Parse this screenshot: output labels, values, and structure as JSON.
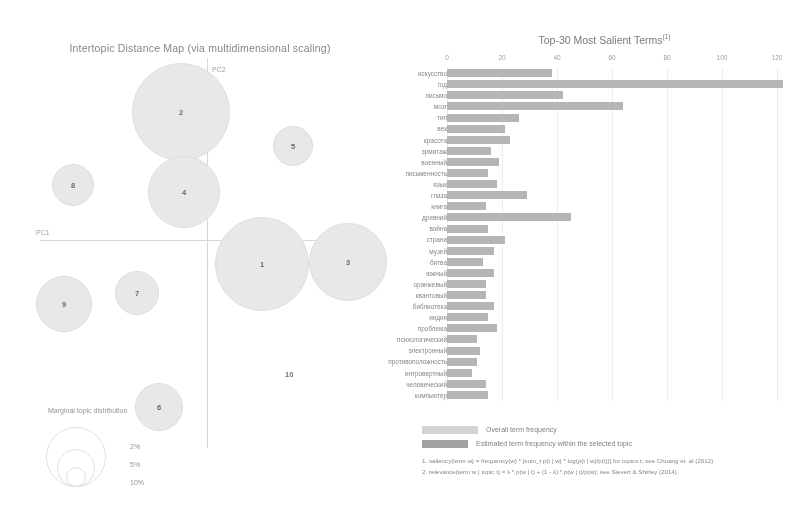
{
  "left": {
    "title": "Intertopic Distance Map (via multidimensional scaling)",
    "axis_labels": {
      "x": "PC1",
      "y": "PC2"
    },
    "topics": [
      {
        "id": "1",
        "x": 262,
        "y": 264,
        "r": 47
      },
      {
        "id": "2",
        "x": 181,
        "y": 112,
        "r": 49
      },
      {
        "id": "3",
        "x": 348,
        "y": 262,
        "r": 39
      },
      {
        "id": "4",
        "x": 184,
        "y": 192,
        "r": 36
      },
      {
        "id": "5",
        "x": 293,
        "y": 146,
        "r": 20
      },
      {
        "id": "6",
        "x": 159,
        "y": 407,
        "r": 24
      },
      {
        "id": "7",
        "x": 137,
        "y": 293,
        "r": 22
      },
      {
        "id": "8",
        "x": 73,
        "y": 185,
        "r": 21
      },
      {
        "id": "9",
        "x": 64,
        "y": 304,
        "r": 28
      }
    ],
    "ghost_topic": {
      "id": "10",
      "x": 285,
      "y": 370
    },
    "marginal": {
      "title": "Marginal topic distribution",
      "items": [
        {
          "label": "2%",
          "r": 10
        },
        {
          "label": "5%",
          "r": 19
        },
        {
          "label": "10%",
          "r": 30
        }
      ]
    }
  },
  "right": {
    "title": "Top-30 Most Salient Terms",
    "title_sup": "(1)",
    "legend": {
      "overall": "Overall term frequency",
      "topic": "Estimated term frequency within the selected topic"
    },
    "footnotes": [
      "1. saliency(term w) = frequency(w) * [sum_t p(t | w) * log(p(t | w)/p(t))] for topics t; see Chuang et. al (2012)",
      "2. relevance(term w | topic t) = λ * p(w | t) + (1 - λ) * p(w | t)/p(w); see Sievert & Shirley (2014)"
    ]
  },
  "chart_data": {
    "type": "bar",
    "title": "Top-30 Most Salient Terms",
    "xlabel": "",
    "ylabel": "",
    "xlim": [
      0,
      128
    ],
    "ticks": [
      0,
      20,
      40,
      60,
      80,
      100,
      120
    ],
    "orientation": "horizontal",
    "grid": false,
    "legend_position": "bottom-left",
    "categories": [
      "искусство",
      "год",
      "письмо",
      "мозг",
      "тип",
      "век",
      "красота",
      "эрмитаж",
      "военный",
      "письменность",
      "язык",
      "глаза",
      "книга",
      "древний",
      "война",
      "страна",
      "музей",
      "битва",
      "южный",
      "оранжевый",
      "квантовый",
      "библиотека",
      "индия",
      "проблема",
      "психологический",
      "электронный",
      "противоположность",
      "интровертный",
      "человеческий",
      "компьютер"
    ],
    "series": [
      {
        "name": "Overall term frequency",
        "values": [
          38,
          122,
          42,
          64,
          26,
          21,
          23,
          16,
          19,
          15,
          18,
          29,
          14,
          45,
          15,
          21,
          17,
          13,
          17,
          14,
          14,
          17,
          15,
          18,
          11,
          12,
          11,
          9,
          14,
          15
        ]
      },
      {
        "name": "Estimated term frequency within the selected topic",
        "values": [
          38,
          122,
          42,
          64,
          26,
          21,
          23,
          16,
          19,
          15,
          18,
          29,
          14,
          45,
          15,
          21,
          17,
          13,
          17,
          14,
          14,
          17,
          15,
          18,
          11,
          12,
          11,
          9,
          14,
          15
        ]
      }
    ]
  }
}
